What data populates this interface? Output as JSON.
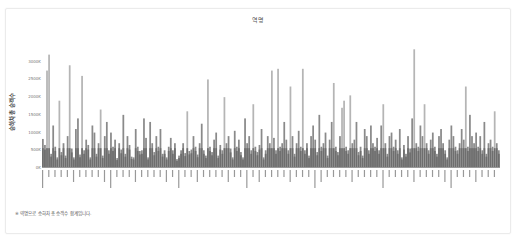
{
  "card": {
    "title": "역명",
    "footnote": "※ 역명으로 승하차 총 승객수 합계입니다."
  },
  "chart_data": {
    "type": "bar",
    "title": "역명",
    "xlabel": "",
    "ylabel": "승하차 총 승객수",
    "ylim": [
      0,
      3500
    ],
    "yunit": "K",
    "yticks": [
      "0K",
      "500K",
      "1000K",
      "1500K",
      "2000K",
      "2500K",
      "3000K"
    ],
    "grid": false,
    "legend": null,
    "bar_color": "#8a8a8a",
    "highlight_color": "#b5b5b5",
    "note": "Category labels (station names, rotated Korean) illegible at source resolution; values estimated from pixel heights.",
    "categories_count": 230,
    "peaks": [
      {
        "approx_index": 3,
        "value": 3200
      },
      {
        "approx_index": 185,
        "value": 3350
      },
      {
        "approx_index": 13,
        "value": 2900
      },
      {
        "approx_index": 126,
        "value": 2800
      },
      {
        "approx_index": 113,
        "value": 2750
      },
      {
        "approx_index": 19,
        "value": 2600
      },
      {
        "approx_index": 150,
        "value": 2400
      },
      {
        "approx_index": 210,
        "value": 2300
      }
    ],
    "values": [
      820,
      650,
      2750,
      3200,
      400,
      1200,
      600,
      300,
      1900,
      450,
      700,
      350,
      900,
      2900,
      550,
      300,
      1100,
      1400,
      380,
      2600,
      500,
      800,
      650,
      300,
      1200,
      1000,
      400,
      700,
      1650,
      350,
      900,
      1300,
      500,
      1000,
      600,
      800,
      280,
      700,
      520,
      1500,
      400,
      900,
      650,
      320,
      300,
      1100,
      600,
      480,
      500,
      1400,
      850,
      300,
      1300,
      700,
      450,
      900,
      600,
      1100,
      400,
      500,
      300,
      600,
      850,
      500,
      700,
      250,
      350,
      500,
      700,
      420,
      1600,
      480,
      520,
      900,
      600,
      380,
      700,
      1250,
      500,
      350,
      2500,
      600,
      450,
      800,
      1000,
      350,
      650,
      500,
      2000,
      700,
      900,
      550,
      300,
      1050,
      600,
      800,
      450,
      300,
      1400,
      700,
      900,
      500,
      1800,
      600,
      450,
      650,
      1100,
      300,
      500,
      900,
      700,
      2750,
      850,
      500,
      2800,
      600,
      700,
      1300,
      800,
      500,
      2300,
      900,
      400,
      700,
      1050,
      600,
      2800,
      500,
      700,
      350,
      900,
      1200,
      800,
      450,
      1500,
      600,
      700,
      1000,
      350,
      800,
      1300,
      2400,
      600,
      450,
      900,
      1700,
      1900,
      600,
      500,
      2050,
      700,
      800,
      1300,
      450,
      600,
      350,
      1100,
      900,
      500,
      1200,
      700,
      600,
      850,
      500,
      1200,
      1800,
      700,
      400,
      900,
      1000,
      600,
      800,
      500,
      1100,
      300,
      650,
      400,
      900,
      550,
      1400,
      3350,
      700,
      600,
      1200,
      900,
      1800,
      700,
      500,
      800,
      1000,
      600,
      400,
      900,
      1100,
      700,
      500,
      300,
      800,
      1200,
      900,
      600,
      500,
      700,
      1100,
      800,
      2300,
      600,
      1500,
      900,
      700,
      1000,
      600,
      900,
      500,
      1300,
      400,
      700,
      800,
      600,
      1600,
      700,
      500
    ]
  }
}
